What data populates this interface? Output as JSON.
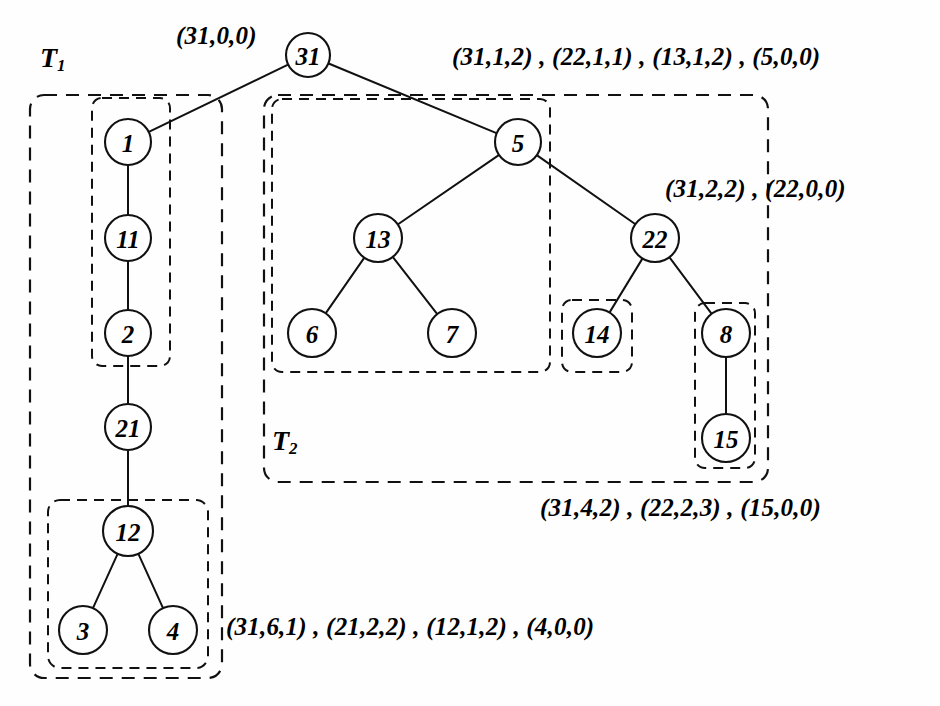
{
  "figure": {
    "type": "binary-tree-diagram",
    "background_color": "#fefefe",
    "stroke_color": "#111111"
  },
  "tree_labels": [
    {
      "name": "T1",
      "base": "T",
      "sub": "1",
      "x": 40,
      "y": 42
    },
    {
      "name": "T2",
      "base": "T",
      "sub": "2",
      "x": 272,
      "y": 425
    }
  ],
  "nodes": [
    {
      "id": "n31",
      "value": "31",
      "x": 308,
      "y": 55,
      "r": 22
    },
    {
      "id": "n1",
      "value": "1",
      "x": 128,
      "y": 142,
      "r": 23
    },
    {
      "id": "n11",
      "value": "11",
      "x": 128,
      "y": 238,
      "r": 23
    },
    {
      "id": "n2",
      "value": "2",
      "x": 128,
      "y": 333,
      "r": 23
    },
    {
      "id": "n21",
      "value": "21",
      "x": 128,
      "y": 427,
      "r": 23
    },
    {
      "id": "n12",
      "value": "12",
      "x": 128,
      "y": 531,
      "r": 25
    },
    {
      "id": "n3",
      "value": "3",
      "x": 83,
      "y": 630,
      "r": 24
    },
    {
      "id": "n4",
      "value": "4",
      "x": 173,
      "y": 630,
      "r": 24
    },
    {
      "id": "n5",
      "value": "5",
      "x": 518,
      "y": 142,
      "r": 23
    },
    {
      "id": "n13",
      "value": "13",
      "x": 378,
      "y": 238,
      "r": 24
    },
    {
      "id": "n6",
      "value": "6",
      "x": 312,
      "y": 333,
      "r": 24
    },
    {
      "id": "n7",
      "value": "7",
      "x": 452,
      "y": 333,
      "r": 24
    },
    {
      "id": "n22",
      "value": "22",
      "x": 655,
      "y": 238,
      "r": 24
    },
    {
      "id": "n14",
      "value": "14",
      "x": 597,
      "y": 333,
      "r": 24
    },
    {
      "id": "n8",
      "value": "8",
      "x": 726,
      "y": 333,
      "r": 24
    },
    {
      "id": "n15",
      "value": "15",
      "x": 726,
      "y": 438,
      "r": 24
    }
  ],
  "edges": [
    {
      "from": "n31",
      "to": "n1",
      "name": "edge-31-1"
    },
    {
      "from": "n31",
      "to": "n5",
      "name": "edge-31-5"
    },
    {
      "from": "n1",
      "to": "n11",
      "name": "edge-1-11"
    },
    {
      "from": "n11",
      "to": "n2",
      "name": "edge-11-2"
    },
    {
      "from": "n2",
      "to": "n21",
      "name": "edge-2-21"
    },
    {
      "from": "n21",
      "to": "n12",
      "name": "edge-21-12"
    },
    {
      "from": "n12",
      "to": "n3",
      "name": "edge-12-3"
    },
    {
      "from": "n12",
      "to": "n4",
      "name": "edge-12-4"
    },
    {
      "from": "n5",
      "to": "n13",
      "name": "edge-5-13"
    },
    {
      "from": "n5",
      "to": "n22",
      "name": "edge-5-22"
    },
    {
      "from": "n13",
      "to": "n6",
      "name": "edge-13-6"
    },
    {
      "from": "n13",
      "to": "n7",
      "name": "edge-13-7"
    },
    {
      "from": "n22",
      "to": "n14",
      "name": "edge-22-14"
    },
    {
      "from": "n22",
      "to": "n8",
      "name": "edge-22-8"
    },
    {
      "from": "n8",
      "to": "n15",
      "name": "edge-8-15"
    }
  ],
  "group_boxes": [
    {
      "name": "group-box-t1-outer",
      "x": 30,
      "y": 95,
      "w": 192,
      "h": 583,
      "rx": 14,
      "kind": "outer"
    },
    {
      "name": "group-box-1-11-2",
      "x": 92,
      "y": 98,
      "w": 78,
      "h": 268,
      "rx": 10,
      "kind": "inner"
    },
    {
      "name": "group-box-12-3-4",
      "x": 48,
      "y": 500,
      "w": 160,
      "h": 168,
      "rx": 12,
      "kind": "inner"
    },
    {
      "name": "group-box-t2-outer",
      "x": 264,
      "y": 95,
      "w": 504,
      "h": 387,
      "rx": 14,
      "kind": "outer"
    },
    {
      "name": "group-box-5-13-6-7",
      "x": 272,
      "y": 99,
      "w": 278,
      "h": 273,
      "rx": 10,
      "kind": "inner"
    },
    {
      "name": "group-box-14",
      "x": 562,
      "y": 300,
      "w": 70,
      "h": 72,
      "rx": 10,
      "kind": "inner"
    },
    {
      "name": "group-box-8-15",
      "x": 695,
      "y": 303,
      "w": 60,
      "h": 165,
      "rx": 10,
      "kind": "inner"
    }
  ],
  "annotations": [
    {
      "name": "annotation-root",
      "text": "(31,0,0)",
      "x": 176,
      "y": 22
    },
    {
      "name": "annotation-top-right",
      "text": "(31,1,2) , (22,1,1) , (13,1,2) , (5,0,0)",
      "x": 452,
      "y": 43
    },
    {
      "name": "annotation-mid-right",
      "text": "(31,2,2) , (22,0,0)",
      "x": 665,
      "y": 175
    },
    {
      "name": "annotation-bottom-right",
      "text": "(31,4,2) , (22,2,3) , (15,0,0)",
      "x": 540,
      "y": 494
    },
    {
      "name": "annotation-bottom-left",
      "text": "(31,6,1) , (21,2,2) , (12,1,2) , (4,0,0)",
      "x": 226,
      "y": 613
    }
  ]
}
